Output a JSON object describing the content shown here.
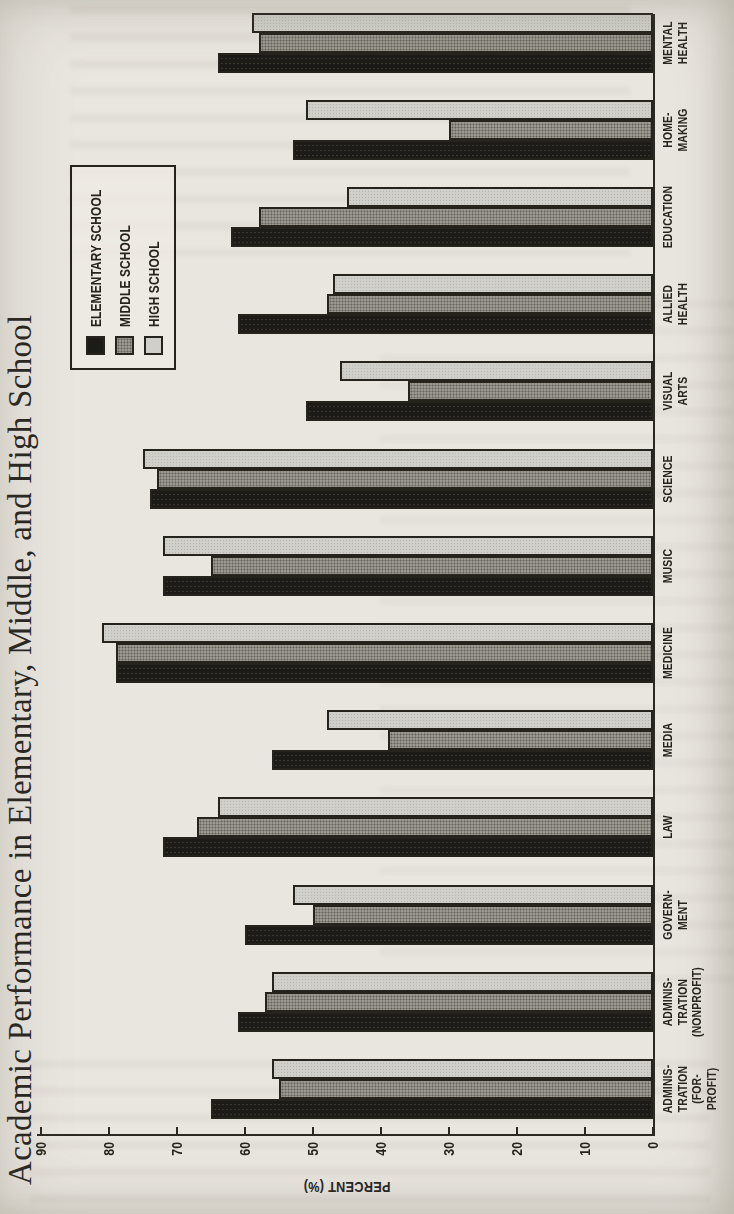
{
  "chart_data": {
    "type": "bar",
    "title": "Academic Performance in Elementary, Middle, and High School",
    "ylabel": "PERCENT (%)",
    "ylim": [
      0,
      90
    ],
    "yticks": [
      0,
      10,
      20,
      30,
      40,
      50,
      60,
      70,
      80,
      90
    ],
    "grid": false,
    "legend_position": "upper-right-inside-plot",
    "figure_rotation_on_page": "rotated 90 degrees counter-clockwise",
    "categories": [
      {
        "label": "ADMINIS-TRATION (FOR-PROFIT)",
        "lines": [
          "ADMINIS-",
          "TRATION",
          "(FOR-PROFIT)"
        ]
      },
      {
        "label": "ADMINIS-TRATION (NONPROFIT)",
        "lines": [
          "ADMINIS-",
          "TRATION",
          "(NONPROFIT)"
        ]
      },
      {
        "label": "GOVERN-MENT",
        "lines": [
          "GOVERN-",
          "MENT"
        ]
      },
      {
        "label": "LAW",
        "lines": [
          "LAW"
        ]
      },
      {
        "label": "MEDIA",
        "lines": [
          "MEDIA"
        ]
      },
      {
        "label": "MEDICINE",
        "lines": [
          "MEDICINE"
        ]
      },
      {
        "label": "MUSIC",
        "lines": [
          "MUSIC"
        ]
      },
      {
        "label": "SCIENCE",
        "lines": [
          "SCIENCE"
        ]
      },
      {
        "label": "VISUAL ARTS",
        "lines": [
          "VISUAL",
          "ARTS"
        ]
      },
      {
        "label": "ALLIED HEALTH",
        "lines": [
          "ALLIED",
          "HEALTH"
        ]
      },
      {
        "label": "EDUCATION",
        "lines": [
          "EDUCATION"
        ]
      },
      {
        "label": "HOME-MAKING",
        "lines": [
          "HOME-",
          "MAKING"
        ]
      },
      {
        "label": "MENTAL HEALTH",
        "lines": [
          "MENTAL",
          "HEALTH"
        ]
      }
    ],
    "series": [
      {
        "name": "ELEMENTARY SCHOOL",
        "color": "#1d1b17",
        "values": [
          65,
          61,
          60,
          72,
          56,
          79,
          72,
          74,
          51,
          61,
          62,
          53,
          64
        ]
      },
      {
        "name": "MIDDLE SCHOOL",
        "color": "#9a988f",
        "values": [
          55,
          57,
          50,
          67,
          39,
          79,
          65,
          73,
          36,
          48,
          58,
          30,
          58
        ]
      },
      {
        "name": "HIGH SCHOOL",
        "color": "#d0cfc9",
        "values": [
          56,
          56,
          53,
          64,
          48,
          81,
          72,
          75,
          46,
          47,
          45,
          51,
          59
        ]
      }
    ]
  }
}
